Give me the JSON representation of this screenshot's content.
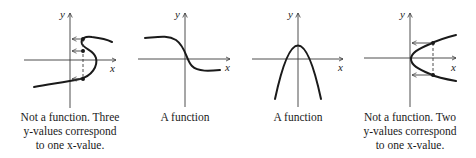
{
  "panels": [
    {
      "id": "s-curve",
      "axis_labels": {
        "x": "x",
        "y": "y"
      },
      "caption": [
        "Not a function. Three",
        "y-values correspond",
        "to one x-value."
      ],
      "is_function": false
    },
    {
      "id": "decreasing-s",
      "axis_labels": {
        "x": "x",
        "y": "y"
      },
      "caption": [
        "A function"
      ],
      "is_function": true
    },
    {
      "id": "downward-parabola",
      "axis_labels": {
        "x": "x",
        "y": "y"
      },
      "caption": [
        "A function"
      ],
      "is_function": true
    },
    {
      "id": "sideways-parabola",
      "axis_labels": {
        "x": "x",
        "y": "y"
      },
      "caption": [
        "Not a function. Two",
        "y-values correspond",
        "to one x-value."
      ],
      "is_function": false
    }
  ],
  "colors": {
    "ink": "#1a1a1a",
    "axis": "#3a3a3a",
    "background": "#ffffff"
  }
}
